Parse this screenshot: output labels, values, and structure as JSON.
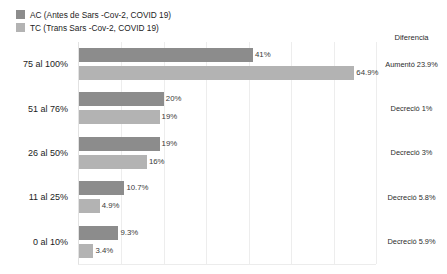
{
  "legend": {
    "items": [
      {
        "label": "AC (Antes de Sars -Cov-2, COVID  19)",
        "color": "#8c8c8c",
        "swatch_name": "legend-swatch-ac"
      },
      {
        "label": "TC (Trans Sars -Cov-2, COVID  19)",
        "color": "#b3b3b3",
        "swatch_name": "legend-swatch-tc"
      }
    ]
  },
  "difference_column": {
    "header": "Diferencia",
    "values": [
      "Aumentó 23.9%",
      "Decreció 1%",
      "Decreció 3%",
      "Decreció 5.8%",
      "Decreció 5.9%"
    ]
  },
  "chart_data": {
    "type": "bar",
    "orientation": "horizontal",
    "title": "",
    "subtitle": "",
    "xlabel": "",
    "ylabel": "",
    "xlim": [
      0,
      70
    ],
    "grid": true,
    "gridlines_x": [
      10,
      20,
      30,
      40,
      50,
      60,
      70
    ],
    "legend_position": "top-left",
    "categories": [
      "75 al 100%",
      "51 al 76%",
      "26 al 50%",
      "11 al 25%",
      "0 al 10%"
    ],
    "series": [
      {
        "name": "AC (Antes de Sars -Cov-2, COVID  19)",
        "color": "#8c8c8c",
        "values": [
          41,
          20,
          19,
          10.7,
          9.3
        ],
        "labels": [
          "41%",
          "20%",
          "19%",
          "10.7%",
          "9.3%"
        ]
      },
      {
        "name": "TC (Trans Sars -Cov-2, COVID  19)",
        "color": "#b3b3b3",
        "values": [
          64.9,
          19,
          16,
          4.9,
          3.4
        ],
        "labels": [
          "64.9%",
          "19%",
          "16%",
          "4.9%",
          "3.4%"
        ]
      }
    ]
  }
}
